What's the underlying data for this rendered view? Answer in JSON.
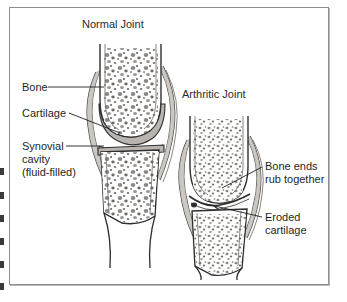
{
  "figure": {
    "title_left": "Normal Joint",
    "title_right": "Arthritic Joint",
    "labels": {
      "bone": "Bone",
      "cartilage": "Cartilage",
      "synovial": "Synovial\ncavity\n(fluid-filled)",
      "bone_ends": "Bone ends\nrub together",
      "eroded": "Eroded\ncartilage"
    },
    "colors": {
      "ink": "#1f1f1f",
      "heading": "#2b2b2b",
      "border": "#8e8e8e",
      "bone_fill": "#ffffff",
      "cartilage_fill": "#b9b4b0",
      "trabecula": "#7a7672",
      "background": "#ffffff"
    }
  }
}
